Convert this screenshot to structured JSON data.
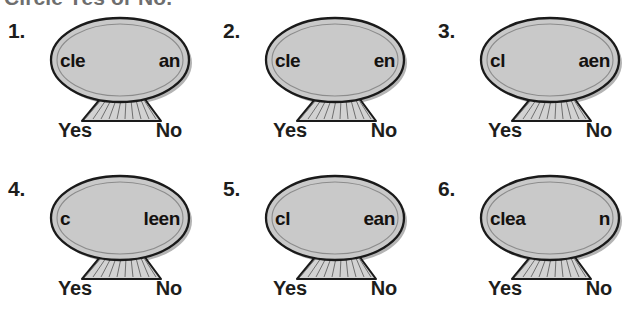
{
  "worksheet": {
    "title": "Circle Yes or No.",
    "answers": {
      "yes_label": "Yes",
      "no_label": "No"
    },
    "colors": {
      "title_gray": "#6e6e6e",
      "text_black": "#1d1d1b",
      "shell_fill": "#c9c9c9",
      "shell_outline": "#1a1a1a",
      "shell_shadow": "#b4b4b4",
      "page_background": "#ffffff"
    },
    "items": [
      {
        "number": "1.",
        "word_left": "cle",
        "word_right": "an",
        "icon": "clam-shell-icon"
      },
      {
        "number": "2.",
        "word_left": "cle",
        "word_right": "en",
        "icon": "clam-shell-icon"
      },
      {
        "number": "3.",
        "word_left": "cl",
        "word_right": "aen",
        "icon": "clam-shell-icon"
      },
      {
        "number": "4.",
        "word_left": "c",
        "word_right": "leen",
        "icon": "clam-shell-icon"
      },
      {
        "number": "5.",
        "word_left": "cl",
        "word_right": "ean",
        "icon": "clam-shell-icon"
      },
      {
        "number": "6.",
        "word_left": "clea",
        "word_right": "n",
        "icon": "clam-shell-icon"
      }
    ]
  }
}
